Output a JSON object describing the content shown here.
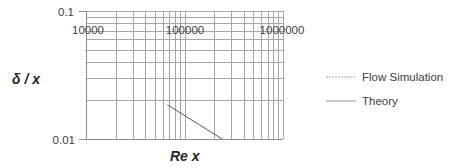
{
  "chart_data": {
    "type": "line",
    "title": "",
    "xlabel": "Re x",
    "ylabel": "δ / x",
    "xscale": "log",
    "yscale": "log",
    "xlim": [
      10000,
      1000000
    ],
    "ylim": [
      0.01,
      0.1
    ],
    "x_tick_labels": [
      "10000",
      "100000",
      "1000000"
    ],
    "y_tick_labels": [
      "0.1",
      "0.01"
    ],
    "grid": true,
    "legend_position": "right",
    "series": [
      {
        "name": "Flow Simulation",
        "style": "dashed",
        "color": "#a6a6a6",
        "x": [],
        "y": []
      },
      {
        "name": "Theory",
        "style": "solid",
        "color": "#595959",
        "x": [
          67000,
          241000
        ],
        "y": [
          0.0185,
          0.01
        ]
      }
    ]
  },
  "axes": {
    "y_top_label": "0.1",
    "y_bottom_label": "0.01",
    "x_labels": [
      "10000",
      "100000",
      "1000000"
    ],
    "x_title": "Re x",
    "y_title": "δ / x"
  },
  "legend": {
    "items": [
      {
        "label": "Flow Simulation"
      },
      {
        "label": "Theory"
      }
    ]
  },
  "colors": {
    "grid": "#a6a6a6",
    "axis": "#8c8c8c",
    "theory": "#595959",
    "text": "#404040"
  }
}
